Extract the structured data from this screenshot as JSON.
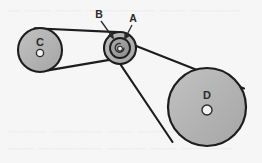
{
  "figure": {
    "background_color": "#f6f6f6",
    "outline_color": "#1d1d1d",
    "labels": {
      "pulley_a": "A",
      "pulley_b": "B",
      "pulley_c": "C",
      "pulley_d": "D"
    },
    "pulleys": [
      {
        "id": "C",
        "label": "C",
        "cx": 40,
        "cy": 50,
        "r": 22,
        "hub_r": 3.6,
        "fill": "#b6b6b6",
        "label_x": 40,
        "label_y": 44
      },
      {
        "id": "B",
        "label": "B",
        "cx": 120,
        "cy": 48,
        "r": 16,
        "fill": "#b0b0b0",
        "label_x": 99,
        "label_y": 17
      },
      {
        "id": "A",
        "label": "A",
        "cx": 120,
        "cy": 48,
        "r": 10,
        "fill": "#9d9d9d",
        "hub_r": 2.6,
        "label_x": 131,
        "label_y": 21
      },
      {
        "id": "D",
        "label": "D",
        "cx": 207,
        "cy": 107,
        "r": 39,
        "hub_r": 5,
        "fill": "#b6b6b6",
        "label_x": 207,
        "label_y": 95
      }
    ],
    "belts": [
      {
        "name": "belt-c-to-b",
        "from": "C",
        "to": "B"
      },
      {
        "name": "belt-a-to-d",
        "from": "A",
        "to": "D"
      }
    ],
    "leaders": [
      {
        "name": "leader-b",
        "x1": 100,
        "y1": 21,
        "x2": 112,
        "y2": 39
      },
      {
        "name": "leader-a",
        "x1": 131,
        "y1": 25,
        "x2": 124,
        "y2": 40
      }
    ]
  }
}
